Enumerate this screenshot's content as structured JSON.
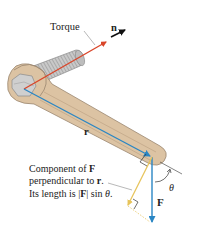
{
  "diagram": {
    "labels": {
      "torque": "Torque",
      "normal_vector": "n",
      "position_vector": "r",
      "force_vector": "F",
      "angle": "θ"
    },
    "caption": {
      "line1_prefix": "Component of ",
      "line1_bold": "F",
      "line2_prefix": "perpendicular to ",
      "line2_bold": "r",
      "line2_suffix": ".",
      "line3_prefix": "Its length is |",
      "line3_bold": "F",
      "line3_mid": "| sin ",
      "line3_italic": "θ",
      "line3_suffix": "."
    },
    "colors": {
      "torque_arrow": "#d9462a",
      "normal_arrow": "#111111",
      "r_vector": "#2a86c4",
      "f_vector": "#2a86c4",
      "perpendicular_component": "#e7c45a",
      "wrench_fill": "#dcc3a3",
      "wrench_stroke": "#9a8670",
      "bolt_fill": "#c8c8c8",
      "bolt_stroke": "#8a8a8a"
    }
  }
}
